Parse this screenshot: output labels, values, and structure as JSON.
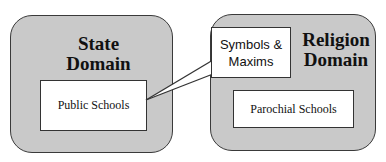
{
  "diagram": {
    "left_domain": {
      "title_line1": "State",
      "title_line2": "Domain",
      "inner_box": "Public Schools"
    },
    "right_domain": {
      "title_line1": "Religion",
      "title_line2": "Domain",
      "inner_box": "Parochial Schools"
    },
    "callout": {
      "line1": "Symbols &",
      "line2": "Maxims",
      "points_from": "Public Schools"
    },
    "colors": {
      "domain_fill": "#c9c9c9",
      "border": "#333333",
      "box_fill": "#ffffff"
    }
  }
}
